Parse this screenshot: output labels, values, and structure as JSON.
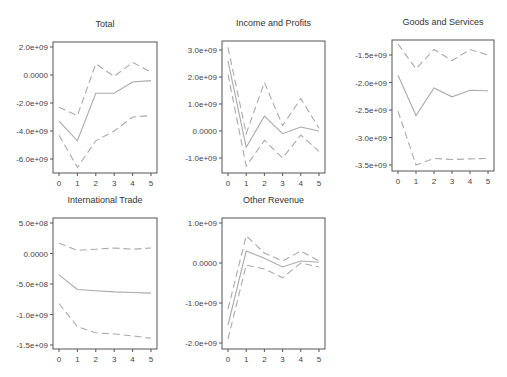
{
  "chart_data": [
    {
      "type": "line",
      "title": "Total",
      "x": [
        0,
        1,
        2,
        3,
        4,
        5
      ],
      "xticks": [
        "0",
        "1",
        "2",
        "3",
        "4",
        "5"
      ],
      "yticks": [
        2000000000.0,
        0,
        -2000000000.0,
        -4000000000.0,
        -6000000000.0
      ],
      "ytick_labels": [
        "2.0e+09",
        "0.0000",
        "-2.0e+09",
        "-4.0e+09",
        "-6.0e+09"
      ],
      "ylim": [
        -7000000000.0,
        2400000000.0
      ],
      "series": [
        {
          "name": "upper",
          "style": "dashed",
          "values": [
            -2300000000.0,
            -2900000000.0,
            800000000.0,
            -100000000.0,
            900000000.0,
            200000000.0
          ]
        },
        {
          "name": "estimate",
          "style": "solid",
          "values": [
            -3300000000.0,
            -4700000000.0,
            -1300000000.0,
            -1300000000.0,
            -500000000.0,
            -400000000.0
          ]
        },
        {
          "name": "lower",
          "style": "dashed",
          "values": [
            -4300000000.0,
            -6600000000.0,
            -4700000000.0,
            -4000000000.0,
            -3000000000.0,
            -2900000000.0
          ]
        }
      ],
      "frame": {
        "left": 53,
        "top": 42,
        "right": 157,
        "bottom": 173
      },
      "ypx": {
        "v0": 2000000000.0,
        "p0": 47,
        "v1": -6000000000.0,
        "p1": 159
      }
    },
    {
      "type": "line",
      "title": "Income and Profits",
      "x": [
        0,
        1,
        2,
        3,
        4,
        5
      ],
      "xticks": [
        "0",
        "1",
        "2",
        "3",
        "4",
        "5"
      ],
      "yticks": [
        3000000000.0,
        2000000000.0,
        1000000000.0,
        0,
        -1000000000.0
      ],
      "ytick_labels": [
        "3.0e+09",
        "2.0e+09",
        "1.0e+09",
        "0.0000",
        "-1.0e+09"
      ],
      "ylim": [
        -1500000000.0,
        3300000000.0
      ],
      "series": [
        {
          "name": "upper",
          "style": "dashed",
          "values": [
            3100000000.0,
            -100000000.0,
            1800000000.0,
            200000000.0,
            1200000000.0,
            100000000.0
          ]
        },
        {
          "name": "estimate",
          "style": "solid",
          "values": [
            2600000000.0,
            -600000000.0,
            550000000.0,
            -100000000.0,
            150000000.0,
            0.0
          ]
        },
        {
          "name": "lower",
          "style": "dashed",
          "values": [
            2100000000.0,
            -1300000000.0,
            -350000000.0,
            -1000000000.0,
            -150000000.0,
            -750000000.0
          ]
        }
      ],
      "frame": {
        "left": 222,
        "top": 41,
        "right": 325,
        "bottom": 173
      },
      "ypx": {
        "v0": 3000000000.0,
        "p0": 50,
        "v1": -1000000000.0,
        "p1": 158
      }
    },
    {
      "type": "line",
      "title": "Goods and Services",
      "x": [
        0,
        1,
        2,
        3,
        4,
        5
      ],
      "xticks": [
        "0",
        "1",
        "2",
        "3",
        "4",
        "5"
      ],
      "yticks": [
        -1500000000.0,
        -2000000000.0,
        -2500000000.0,
        -3000000000.0,
        -3500000000.0
      ],
      "ytick_labels": [
        "-1.5e+09",
        "-2.0e+09",
        "-2.5e+09",
        "-3.0e+09",
        "-3.5e+09"
      ],
      "ylim": [
        -3600000000.0,
        -1250000000.0
      ],
      "series": [
        {
          "name": "upper",
          "style": "dashed",
          "values": [
            -1300000000.0,
            -1750000000.0,
            -1400000000.0,
            -1600000000.0,
            -1400000000.0,
            -1500000000.0
          ]
        },
        {
          "name": "estimate",
          "style": "solid",
          "values": [
            -1870000000.0,
            -2600000000.0,
            -2100000000.0,
            -2260000000.0,
            -2140000000.0,
            -2150000000.0
          ]
        },
        {
          "name": "lower",
          "style": "dashed",
          "values": [
            -2520000000.0,
            -3500000000.0,
            -3380000000.0,
            -3400000000.0,
            -3390000000.0,
            -3380000000.0
          ]
        }
      ],
      "frame": {
        "left": 392,
        "top": 40,
        "right": 494,
        "bottom": 171
      },
      "ypx": {
        "v0": -1500000000.0,
        "p0": 55,
        "v1": -3500000000.0,
        "p1": 165
      }
    },
    {
      "type": "line",
      "title": "International Trade",
      "x": [
        0,
        1,
        2,
        3,
        4,
        5
      ],
      "xticks": [
        "0",
        "1",
        "2",
        "3",
        "4",
        "5"
      ],
      "yticks": [
        500000000.0,
        0,
        -500000000.0,
        -1000000000.0,
        -1500000000.0
      ],
      "ytick_labels": [
        "5.0e+08",
        "0.0000",
        "-5.0e+08",
        "-1.0e+09",
        "-1.5e+09"
      ],
      "ylim": [
        -1550000000.0,
        580000000.0
      ],
      "series": [
        {
          "name": "upper",
          "style": "dashed",
          "values": [
            170000000.0,
            50000000.0,
            70000000.0,
            90000000.0,
            70000000.0,
            90000000.0
          ]
        },
        {
          "name": "estimate",
          "style": "solid",
          "values": [
            -350000000.0,
            -590000000.0,
            -610000000.0,
            -630000000.0,
            -640000000.0,
            -650000000.0
          ]
        },
        {
          "name": "lower",
          "style": "dashed",
          "values": [
            -820000000.0,
            -1200000000.0,
            -1300000000.0,
            -1320000000.0,
            -1350000000.0,
            -1390000000.0
          ]
        }
      ],
      "frame": {
        "left": 53,
        "top": 218,
        "right": 157,
        "bottom": 349
      },
      "ypx": {
        "v0": 500000000.0,
        "p0": 223,
        "v1": -1500000000.0,
        "p1": 345
      }
    },
    {
      "type": "line",
      "title": "Other Revenue",
      "x": [
        0,
        1,
        2,
        3,
        4,
        5
      ],
      "xticks": [
        "0",
        "1",
        "2",
        "3",
        "4",
        "5"
      ],
      "yticks": [
        1000000000.0,
        0,
        -1000000000.0,
        -2000000000.0
      ],
      "ytick_labels": [
        "1.0e+09",
        "0.0000",
        "-1.0e+09",
        "-2.0e+09"
      ],
      "ylim": [
        -2150000000.0,
        1150000000.0
      ],
      "series": [
        {
          "name": "upper",
          "style": "dashed",
          "values": [
            -1150000000.0,
            680000000.0,
            250000000.0,
            50000000.0,
            300000000.0,
            50000000.0
          ]
        },
        {
          "name": "estimate",
          "style": "solid",
          "values": [
            -1550000000.0,
            300000000.0,
            120000000.0,
            -100000000.0,
            50000000.0,
            20000000.0
          ]
        },
        {
          "name": "lower",
          "style": "dashed",
          "values": [
            -1900000000.0,
            -50000000.0,
            -150000000.0,
            -370000000.0,
            0.0,
            -100000000.0
          ]
        }
      ],
      "frame": {
        "left": 222,
        "top": 218,
        "right": 325,
        "bottom": 349
      },
      "ypx": {
        "v0": 1000000000.0,
        "p0": 223,
        "v1": -2000000000.0,
        "p1": 343
      }
    }
  ]
}
